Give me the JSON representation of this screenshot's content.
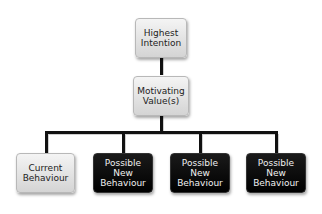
{
  "diagram": {
    "nodes": [
      {
        "id": "highest",
        "label": "Highest Intention",
        "lines": [
          "Highest",
          "Intention"
        ],
        "style": "light"
      },
      {
        "id": "motivating",
        "label": "Motivating Value(s)",
        "lines": [
          "Motivating",
          "Value(s)"
        ],
        "style": "light"
      },
      {
        "id": "current",
        "label": "Current Behaviour",
        "lines": [
          "Current",
          "Behaviour"
        ],
        "style": "light"
      },
      {
        "id": "new1",
        "label": "Possible New Behaviour",
        "lines": [
          "Possible",
          "New",
          "Behaviour"
        ],
        "style": "dark"
      },
      {
        "id": "new2",
        "label": "Possible New Behaviour",
        "lines": [
          "Possible",
          "New",
          "Behaviour"
        ],
        "style": "dark"
      },
      {
        "id": "new3",
        "label": "Possible New Behaviour",
        "lines": [
          "Possible",
          "New",
          "Behaviour"
        ],
        "style": "dark"
      }
    ],
    "edges": [
      [
        "highest",
        "motivating"
      ],
      [
        "motivating",
        "current"
      ],
      [
        "motivating",
        "new1"
      ],
      [
        "motivating",
        "new2"
      ],
      [
        "motivating",
        "new3"
      ]
    ],
    "colors": {
      "light_box": "#e4e4e4",
      "dark_box": "#000000",
      "connector": "#111111"
    }
  }
}
